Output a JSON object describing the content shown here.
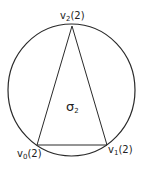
{
  "diagram": {
    "type": "simplex-in-circle",
    "colors": {
      "stroke": "#2a2a2a",
      "text": "#222222",
      "background": "#ffffff"
    },
    "vertices": [
      {
        "id": "v0",
        "base": "v",
        "subscript": "0",
        "suffix": "(2)"
      },
      {
        "id": "v1",
        "base": "v",
        "subscript": "1",
        "suffix": "(2)"
      },
      {
        "id": "v2",
        "base": "v",
        "subscript": "2",
        "suffix": "(2)"
      }
    ],
    "face_label": {
      "base": "σ",
      "subscript": "2"
    }
  }
}
